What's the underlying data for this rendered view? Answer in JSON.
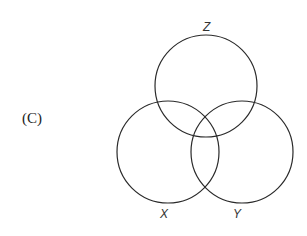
{
  "option_label": "(C)",
  "diagram": {
    "type": "venn",
    "sets": [
      {
        "name": "Z",
        "label": "Z",
        "cx": 206,
        "cy": 86,
        "r": 51
      },
      {
        "name": "X",
        "label": "X",
        "cx": 168,
        "cy": 152,
        "r": 51
      },
      {
        "name": "Y",
        "label": "Y",
        "cx": 242,
        "cy": 152,
        "r": 51
      }
    ],
    "stroke_color": "#2a2a2a"
  }
}
